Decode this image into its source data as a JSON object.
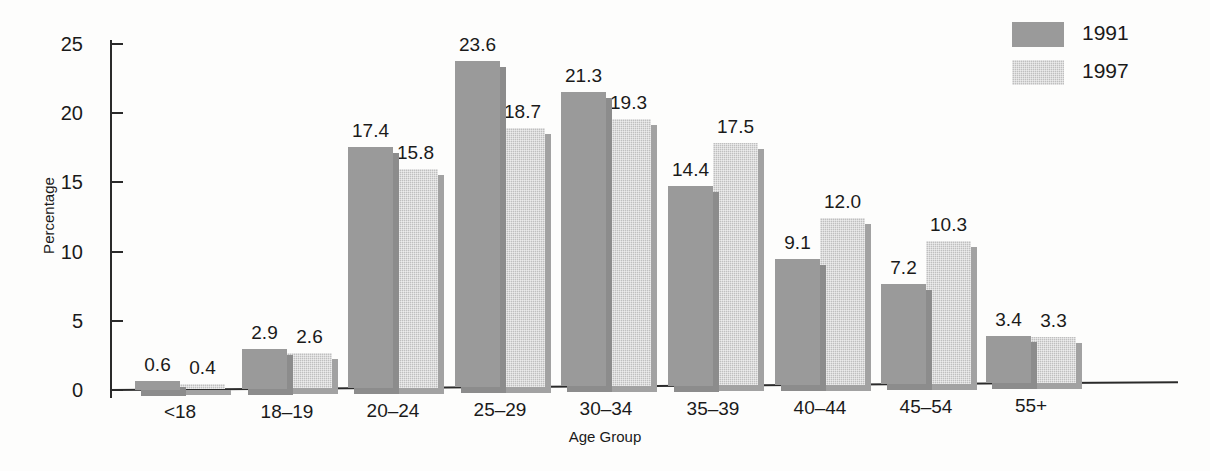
{
  "chart_data": {
    "type": "bar",
    "title": "",
    "xlabel": "Age Group",
    "ylabel": "Percentage",
    "categories": [
      "<18",
      "18–19",
      "20–24",
      "25–29",
      "30–34",
      "35–39",
      "40–44",
      "45–54",
      "55+"
    ],
    "series": [
      {
        "name": "1991",
        "values": [
          0.6,
          2.9,
          17.4,
          23.6,
          21.3,
          14.4,
          9.1,
          7.2,
          3.4
        ],
        "color": "#9a9a9a"
      },
      {
        "name": "1997",
        "values": [
          0.4,
          2.6,
          15.8,
          18.7,
          19.3,
          17.5,
          12.0,
          10.3,
          3.3
        ],
        "color": "#bfbfbf"
      }
    ],
    "value_labels": [
      [
        "0.6",
        "2.9",
        "17.4",
        "23.6",
        "21.3",
        "14.4",
        "9.1",
        "7.2",
        "3.4"
      ],
      [
        "0.4",
        "2.6",
        "15.8",
        "18.7",
        "19.3",
        "17.5",
        "12.0",
        "10.3",
        "3.3"
      ]
    ],
    "ylim": [
      0,
      25
    ],
    "yticks": [
      0,
      5,
      10,
      15,
      20,
      25
    ],
    "ytick_labels": [
      "0",
      "5",
      "10",
      "15",
      "20",
      "25"
    ],
    "grid": false,
    "legend_position": "top-right",
    "background_color": "#fdfdfc",
    "axis_color": "#2a2a2a"
  },
  "legend": {
    "entries": [
      {
        "label": "1991"
      },
      {
        "label": "1997"
      }
    ]
  }
}
